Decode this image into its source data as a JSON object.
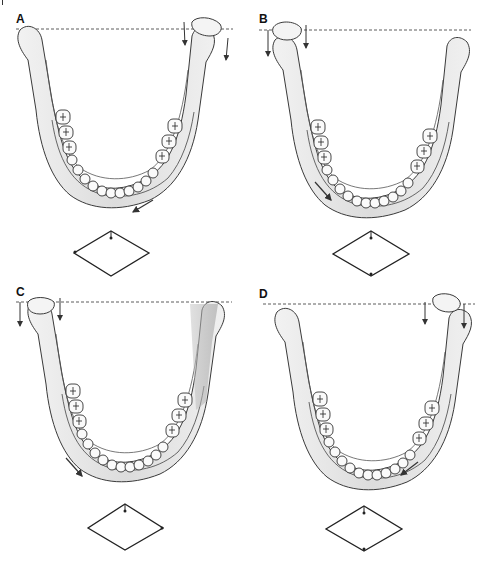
{
  "figure": {
    "panels": [
      {
        "id": "A",
        "label": "A",
        "tilted_side": "right",
        "movement_arrow": "down-left",
        "diamond_marker": "left-vertex"
      },
      {
        "id": "B",
        "label": "B",
        "tilted_side": "left",
        "movement_arrow": "down-right",
        "diamond_marker": "bottom-vertex"
      },
      {
        "id": "C",
        "label": "C",
        "tilted_side": "left",
        "movement_arrow": "down-right",
        "diamond_marker": "right-vertex"
      },
      {
        "id": "D",
        "label": "D",
        "tilted_side": "right",
        "movement_arrow": "down-left",
        "diamond_marker": "bottom-vertex"
      }
    ],
    "colors": {
      "line": "#333333",
      "bone_shade": "#d8d8d8",
      "bone_dark_shade": "#a8a8a8",
      "background": "#ffffff"
    }
  }
}
